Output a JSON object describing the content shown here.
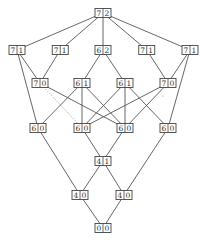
{
  "diagram": {
    "type": "hasse-lattice",
    "nodes": [
      {
        "id": "n0",
        "left": "7",
        "right": "2",
        "level": 0,
        "col": 2
      },
      {
        "id": "n1",
        "left": "7",
        "right": "1",
        "level": 1,
        "col": 0
      },
      {
        "id": "n2",
        "left": "7",
        "right": "1",
        "level": 1,
        "col": 1
      },
      {
        "id": "n3",
        "left": "6",
        "right": "2",
        "level": 1,
        "col": 2
      },
      {
        "id": "n4",
        "left": "7",
        "right": "1",
        "level": 1,
        "col": 3
      },
      {
        "id": "n5",
        "left": "7",
        "right": "1",
        "level": 1,
        "col": 4
      },
      {
        "id": "n6",
        "left": "7",
        "right": "0",
        "level": 2,
        "col": 0.5
      },
      {
        "id": "n7",
        "left": "6",
        "right": "1",
        "level": 2,
        "col": 1.5
      },
      {
        "id": "n8",
        "left": "6",
        "right": "1",
        "level": 2,
        "col": 2.5
      },
      {
        "id": "n9",
        "left": "7",
        "right": "0",
        "level": 2,
        "col": 3.5
      },
      {
        "id": "n10",
        "left": "6",
        "right": "0",
        "level": 3,
        "col": 0.5
      },
      {
        "id": "n11",
        "left": "6",
        "right": "0",
        "level": 3,
        "col": 1.5
      },
      {
        "id": "n12",
        "left": "6",
        "right": "0",
        "level": 3,
        "col": 2.5
      },
      {
        "id": "n13",
        "left": "6",
        "right": "0",
        "level": 3,
        "col": 3.5
      },
      {
        "id": "n14",
        "left": "4",
        "right": "1",
        "level": 4,
        "col": 2
      },
      {
        "id": "n15",
        "left": "4",
        "right": "0",
        "level": 5,
        "col": 1.5
      },
      {
        "id": "n16",
        "left": "4",
        "right": "0",
        "level": 5,
        "col": 2.5
      },
      {
        "id": "n17",
        "left": "0",
        "right": "0",
        "level": 6,
        "col": 2
      }
    ],
    "edges": [
      {
        "from": "n0",
        "to": "n1"
      },
      {
        "from": "n0",
        "to": "n2"
      },
      {
        "from": "n0",
        "to": "n3"
      },
      {
        "from": "n0",
        "to": "n4"
      },
      {
        "from": "n0",
        "to": "n5"
      },
      {
        "from": "n1",
        "to": "n6"
      },
      {
        "from": "n1",
        "to": "n10"
      },
      {
        "from": "n2",
        "to": "n6"
      },
      {
        "from": "n3",
        "to": "n7"
      },
      {
        "from": "n3",
        "to": "n8"
      },
      {
        "from": "n4",
        "to": "n9"
      },
      {
        "from": "n5",
        "to": "n9"
      },
      {
        "from": "n5",
        "to": "n13"
      },
      {
        "from": "n6",
        "to": "n11",
        "style": "dotted"
      },
      {
        "from": "n6",
        "to": "n12"
      },
      {
        "from": "n7",
        "to": "n10"
      },
      {
        "from": "n7",
        "to": "n11"
      },
      {
        "from": "n7",
        "to": "n12"
      },
      {
        "from": "n8",
        "to": "n11"
      },
      {
        "from": "n8",
        "to": "n12"
      },
      {
        "from": "n8",
        "to": "n13"
      },
      {
        "from": "n9",
        "to": "n11"
      },
      {
        "from": "n9",
        "to": "n12"
      },
      {
        "from": "n10",
        "to": "n15"
      },
      {
        "from": "n11",
        "to": "n14"
      },
      {
        "from": "n12",
        "to": "n14"
      },
      {
        "from": "n13",
        "to": "n16"
      },
      {
        "from": "n14",
        "to": "n15"
      },
      {
        "from": "n14",
        "to": "n16"
      },
      {
        "from": "n15",
        "to": "n17"
      },
      {
        "from": "n16",
        "to": "n17"
      }
    ]
  }
}
